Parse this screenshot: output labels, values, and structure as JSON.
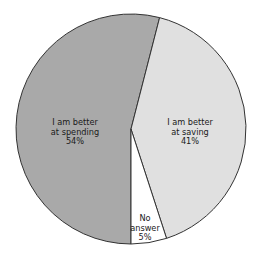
{
  "chart_data": {
    "type": "pie",
    "title": "",
    "categories": [
      "I am better at spending",
      "I am better at saving",
      "No answer"
    ],
    "values": [
      54,
      41,
      5
    ],
    "unit": "%",
    "slices": [
      {
        "name": "I am better at spending",
        "value": 54,
        "label_lines": [
          "I am better",
          "at spending",
          "54%"
        ],
        "color": "#a9a9a9",
        "label_pos": [
          75,
          125
        ]
      },
      {
        "name": "I am better at saving",
        "value": 41,
        "label_lines": [
          "I am better",
          "at saving",
          "41%"
        ],
        "color": "#e0e0e0",
        "label_pos": [
          190,
          125
        ]
      },
      {
        "name": "No answer",
        "value": 5,
        "label_lines": [
          "No",
          "answer",
          "5%"
        ],
        "color": "#ffffff",
        "label_pos": [
          145,
          221
        ]
      }
    ],
    "start_angle_deg": 180,
    "direction": "clockwise",
    "legend": "none",
    "center": [
      131,
      129
    ],
    "radius": 115,
    "outline_color": "#333333"
  }
}
